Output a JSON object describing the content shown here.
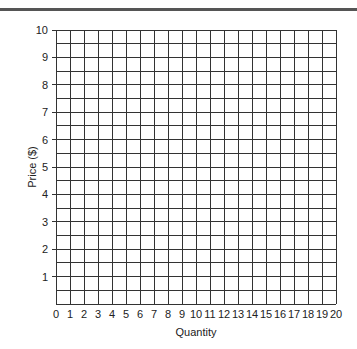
{
  "chart_data": {
    "type": "line",
    "title": "",
    "xlabel": "Quantity",
    "ylabel": "Price ($)",
    "x_ticks": [
      "0",
      "1",
      "2",
      "3",
      "4",
      "5",
      "6",
      "7",
      "8",
      "9",
      "10",
      "11",
      "12",
      "13",
      "14",
      "15",
      "16",
      "17",
      "18",
      "19",
      "20"
    ],
    "y_ticks": [
      "1",
      "2",
      "3",
      "4",
      "5",
      "6",
      "7",
      "8",
      "9",
      "10"
    ],
    "xlim": [
      0,
      20
    ],
    "ylim": [
      0,
      10
    ],
    "grid": true,
    "grid_x_step": 1,
    "grid_y_step": 0.5,
    "series": [],
    "legend": null
  },
  "style": {
    "grid_color": "#333333",
    "topbar_color": "#555555"
  }
}
